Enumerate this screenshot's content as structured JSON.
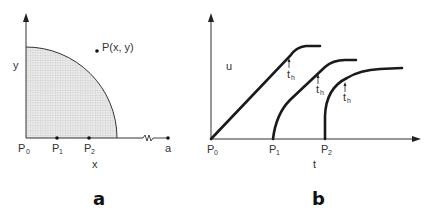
{
  "panel_a": {
    "label": "a",
    "y_axis_label": "y",
    "x_axis_label": "x",
    "point_label": "P(x, y)",
    "origin_label": "P",
    "origin_sub": "0",
    "p1_label": "P",
    "p1_sub": "1",
    "p2_label": "P",
    "p2_sub": "2",
    "end_label": "a"
  },
  "panel_b": {
    "label": "b",
    "y_axis_label": "u",
    "x_axis_label": "t",
    "origin_label": "P",
    "origin_sub": "0",
    "p1_label": "P",
    "p1_sub": "1",
    "p2_label": "P",
    "p2_sub": "2",
    "annotations": [
      {
        "label": "t",
        "sub": "h"
      },
      {
        "label": "t",
        "sub": "h"
      },
      {
        "label": "t",
        "sub": "h"
      }
    ]
  },
  "colors": {
    "line": "#2a2a2a",
    "fill": "#d9d9d9",
    "grid": "#bdbdbd"
  }
}
